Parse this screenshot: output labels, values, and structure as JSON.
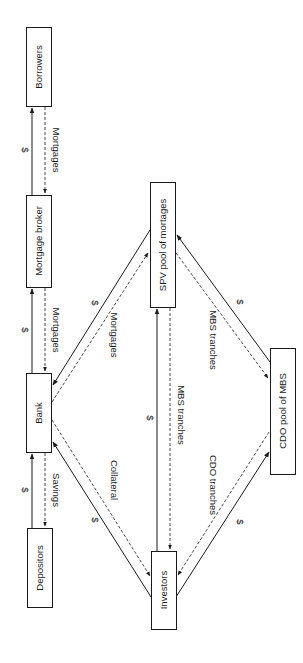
{
  "diagram": {
    "orientation": "rotated-90-clockwise",
    "nodes": {
      "borrowers": "Borrowers",
      "mortgage_broker": "Mortgage broker",
      "bank": "Bank",
      "depositors": "Depositors",
      "spv": "SPV pool of mortages",
      "investors": "Investors",
      "cdo": "CDO pool of MBS"
    },
    "edges": {
      "broker_to_borrowers_money": "$",
      "borrowers_to_broker_mortgages": "Mortgages",
      "bank_to_broker_money": "$",
      "broker_to_bank_mortgages": "Mortgages",
      "depositors_to_bank_money": "$",
      "bank_to_depositors_savings": "Savings",
      "spv_to_bank_money": "$",
      "bank_to_spv_mortgages": "Mortgages",
      "investors_to_bank_money": "$",
      "bank_to_investors_collateral": "Collateral",
      "investors_to_spv_money": "$",
      "spv_to_investors_mbs": "MBS tranches",
      "cdo_to_spv_money": "$",
      "spv_to_cdo_mbs": "MBS tranches",
      "investors_to_cdo_money": "$",
      "cdo_to_investors_cdo": "CDO tranches"
    }
  }
}
